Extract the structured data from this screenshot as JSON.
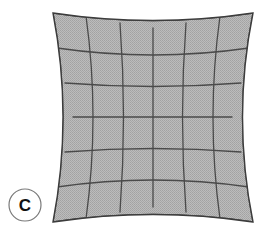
{
  "figure": {
    "panel_label": "C",
    "caption": "",
    "label_position": {
      "cx": 25,
      "cy": 205,
      "r": 16
    }
  },
  "diagram": {
    "type": "pincushion-distortion-grid",
    "name": "pincushion-grid",
    "corners": {
      "top_left": [
        53,
        13
      ],
      "top_right": [
        253,
        13
      ],
      "bottom_right": [
        253,
        222
      ],
      "bottom_left": [
        53,
        222
      ]
    },
    "edge_midpoints": {
      "top": [
        153,
        28
      ],
      "right": [
        232,
        117
      ],
      "bottom": [
        153,
        207
      ],
      "left": [
        73,
        117
      ]
    },
    "grid": {
      "columns": 6,
      "rows": 6,
      "vertical_line_count": 7,
      "horizontal_line_count": 7
    },
    "colors": {
      "fill": "#b4b4b4",
      "fill_dither": "#9d9d9d",
      "grid_line": "#4a4a4a",
      "outline": "#3c3c3c",
      "background": "#ffffff",
      "label_circle_stroke": "#7a7a7a",
      "label_text": "#111111"
    },
    "stroke_widths": {
      "outline": 1.4,
      "grid_line": 1.3,
      "label_circle": 1.2
    }
  }
}
